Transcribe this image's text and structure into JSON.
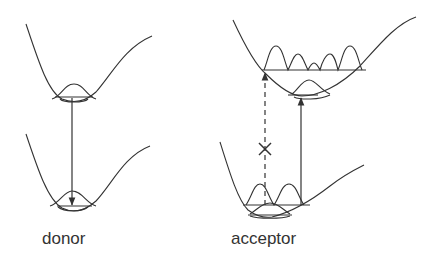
{
  "figure": {
    "panels": [
      {
        "id": "donor",
        "label": "donor",
        "transition": "emission (downward arrow, upper well ground level to lower well)"
      },
      {
        "id": "acceptor",
        "label": "acceptor",
        "transitions": [
          {
            "type": "allowed",
            "style": "solid",
            "direction": "up"
          },
          {
            "type": "forbidden",
            "style": "dashed",
            "marker": "×",
            "direction": "up"
          }
        ]
      }
    ],
    "forbidden_marker": "×",
    "colors": {
      "stroke": "#333333",
      "background": "#ffffff"
    }
  }
}
